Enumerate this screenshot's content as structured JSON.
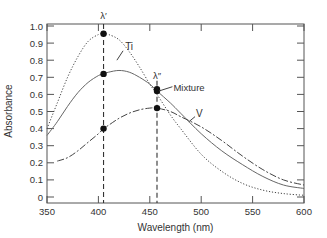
{
  "chart_data": {
    "type": "line",
    "title": "",
    "xlabel": "Wavelength (nm)",
    "ylabel": "Absorbance",
    "xlim": [
      350,
      600
    ],
    "ylim": [
      0,
      1.0
    ],
    "x_ticks": [
      350,
      400,
      450,
      500,
      550,
      600
    ],
    "y_ticks": [
      0,
      0.1,
      0.2,
      0.3,
      0.4,
      0.5,
      0.6,
      0.7,
      0.8,
      0.9,
      1.0
    ],
    "y_tick_labels": [
      "0",
      "0.1",
      "0.2",
      "0.3",
      "0.4",
      "0.5",
      "0.6",
      "0.7",
      "0.8",
      "0.9",
      "1.0"
    ],
    "grid": false,
    "series": [
      {
        "name": "Ti",
        "style": "dotted",
        "x": [
          350,
          360,
          370,
          380,
          390,
          400,
          405,
          410,
          420,
          430,
          440,
          450,
          457,
          470,
          480,
          500,
          520,
          540,
          560,
          580,
          600
        ],
        "y": [
          0.4,
          0.55,
          0.7,
          0.82,
          0.91,
          0.95,
          0.955,
          0.95,
          0.92,
          0.85,
          0.76,
          0.66,
          0.6,
          0.48,
          0.4,
          0.25,
          0.15,
          0.08,
          0.04,
          0.02,
          0.01
        ]
      },
      {
        "name": "Mixture",
        "style": "solid",
        "x": [
          350,
          360,
          370,
          380,
          390,
          400,
          405,
          410,
          420,
          430,
          440,
          450,
          457,
          470,
          480,
          500,
          520,
          540,
          560,
          580,
          600
        ],
        "y": [
          0.36,
          0.44,
          0.53,
          0.61,
          0.67,
          0.71,
          0.72,
          0.73,
          0.74,
          0.73,
          0.7,
          0.66,
          0.62,
          0.55,
          0.49,
          0.37,
          0.27,
          0.19,
          0.12,
          0.07,
          0.05
        ]
      },
      {
        "name": "V",
        "style": "dashed",
        "x": [
          360,
          370,
          380,
          390,
          400,
          405,
          410,
          420,
          430,
          440,
          450,
          457,
          470,
          480,
          500,
          520,
          540,
          560,
          580,
          600
        ],
        "y": [
          0.21,
          0.23,
          0.27,
          0.32,
          0.37,
          0.4,
          0.42,
          0.46,
          0.49,
          0.51,
          0.52,
          0.52,
          0.5,
          0.47,
          0.41,
          0.33,
          0.24,
          0.16,
          0.1,
          0.07
        ]
      }
    ],
    "vertical_lines": [
      {
        "label": "λ′",
        "x": 405
      },
      {
        "label": "λ″",
        "x": 457
      }
    ],
    "markers": [
      {
        "x": 405,
        "y": 0.955,
        "series": "Ti"
      },
      {
        "x": 405,
        "y": 0.72,
        "series": "Mixture"
      },
      {
        "x": 405,
        "y": 0.4,
        "series": "V"
      },
      {
        "x": 457,
        "y": 0.63,
        "series": "Ti"
      },
      {
        "x": 457,
        "y": 0.62,
        "series": "Mixture"
      },
      {
        "x": 457,
        "y": 0.52,
        "series": "V"
      }
    ],
    "annotations": [
      {
        "text": "Ti",
        "x": 425,
        "y": 0.88
      },
      {
        "text": "Mixture",
        "x": 475,
        "y": 0.63
      },
      {
        "text": "V",
        "x": 495,
        "y": 0.5
      },
      {
        "text": "λ′",
        "x": 405,
        "y": 1.04
      },
      {
        "text": "λ″",
        "x": 457,
        "y": 0.7
      }
    ]
  }
}
